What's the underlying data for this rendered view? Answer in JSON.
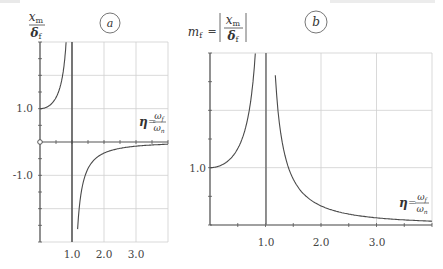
{
  "chart_data": [
    {
      "id": "a",
      "type": "line",
      "panel_label": "a",
      "title": "",
      "ylabel_num": "x_m",
      "ylabel_den": "δ_f",
      "xlabel": "η = ω_f / ω_n",
      "function": "x_m/δ_f = 1/(1 - η^2)",
      "xlim": [
        0,
        4
      ],
      "ylim": [
        -3,
        3
      ],
      "xticks": [
        1.0,
        2.0,
        3.0
      ],
      "xtick_labels": [
        "1.0",
        "2.0",
        "3.0"
      ],
      "yticks": [
        1.0,
        -1.0
      ],
      "ytick_labels": [
        "1.0",
        "-1.0"
      ],
      "vertical_asymptote": 1.0,
      "grid": true,
      "series": [
        {
          "name": "below resonance",
          "x": [
            0,
            0.2,
            0.4,
            0.5,
            0.6,
            0.7,
            0.75,
            0.8,
            0.82
          ],
          "y": [
            1.0,
            1.04,
            1.19,
            1.33,
            1.56,
            1.96,
            2.29,
            2.78,
            3.04
          ]
        },
        {
          "name": "above resonance",
          "x": [
            1.15,
            1.2,
            1.3,
            1.5,
            1.75,
            2.0,
            2.5,
            3.0,
            3.5,
            4.0
          ],
          "y": [
            -3.08,
            -2.27,
            -1.45,
            -0.8,
            -0.48,
            -0.33,
            -0.19,
            -0.125,
            -0.089,
            -0.067
          ]
        }
      ]
    },
    {
      "id": "b",
      "type": "line",
      "panel_label": "b",
      "title": "",
      "ylabel_prefix": "m_f =",
      "ylabel_num": "x_m",
      "ylabel_den": "δ_f",
      "xlabel": "η = ω_f / ω_n",
      "function": "m_f = |1/(1 - η^2)|",
      "xlim": [
        0,
        4
      ],
      "ylim": [
        0,
        3
      ],
      "xticks": [
        1.0,
        2.0,
        3.0
      ],
      "xtick_labels": [
        "1.0",
        "2.0",
        "3.0"
      ],
      "yticks": [
        1.0
      ],
      "ytick_labels": [
        "1.0"
      ],
      "vertical_asymptote": 1.0,
      "grid": true,
      "series": [
        {
          "name": "below resonance",
          "x": [
            0,
            0.2,
            0.4,
            0.5,
            0.6,
            0.7,
            0.75,
            0.8,
            0.82
          ],
          "y": [
            1.0,
            1.04,
            1.19,
            1.33,
            1.56,
            1.96,
            2.29,
            2.78,
            3.04
          ]
        },
        {
          "name": "above resonance",
          "x": [
            1.15,
            1.2,
            1.3,
            1.5,
            1.75,
            2.0,
            2.5,
            3.0,
            3.5,
            4.0
          ],
          "y": [
            3.08,
            2.27,
            1.45,
            0.8,
            0.48,
            0.33,
            0.19,
            0.125,
            0.089,
            0.067
          ]
        }
      ]
    }
  ],
  "labels": {
    "panel_a": "a",
    "panel_b": "b",
    "a_ynum": "x",
    "a_ynum_sub": "m",
    "a_yden": "δ",
    "a_yden_sub": "f",
    "b_prefix": "m",
    "b_prefix_sub": "f",
    "b_eq": "=",
    "b_ynum": "x",
    "b_ynum_sub": "m",
    "b_yden": "δ",
    "b_yden_sub": "f",
    "eta": "η",
    "eq": "=",
    "omega": "ω",
    "omega_f_sub": "f",
    "omega_n_sub": "n",
    "a_x1": "1.0",
    "a_x2": "2.0",
    "a_x3": "3.0",
    "a_y1": "1.0",
    "a_ym1": "-1.0",
    "b_x1": "1.0",
    "b_x2": "2.0",
    "b_x3": "3.0",
    "b_y1": "1.0"
  },
  "colors": {
    "curve": "#4a4a4a",
    "axis": "#555555",
    "grid": "#cfcfcf",
    "asymptote": "#444444"
  }
}
